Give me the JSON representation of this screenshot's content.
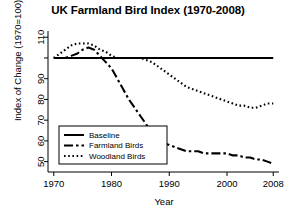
{
  "chart_data": {
    "type": "line",
    "title": "UK Farmland Bird Index (1970-2008)",
    "xlabel": "Year",
    "ylabel": "Index of Change (1970=100)",
    "xlim": [
      1969,
      2009
    ],
    "ylim": [
      45,
      113
    ],
    "grid": false,
    "legend_position": "bottom-left",
    "xticks": [
      1970,
      1980,
      1990,
      2000,
      2008
    ],
    "xtick_labels": [
      "1970",
      "1980",
      "1990",
      "2000",
      "2008"
    ],
    "yticks": [
      50,
      60,
      70,
      80,
      90,
      100,
      110
    ],
    "ytick_labels": [
      "50",
      "60",
      "70",
      "80",
      "90",
      "",
      "110"
    ],
    "x": [
      1970,
      1971,
      1972,
      1973,
      1974,
      1975,
      1976,
      1977,
      1978,
      1979,
      1980,
      1981,
      1982,
      1983,
      1984,
      1985,
      1986,
      1987,
      1988,
      1989,
      1990,
      1991,
      1992,
      1993,
      1994,
      1995,
      1996,
      1997,
      1998,
      1999,
      2000,
      2001,
      2002,
      2003,
      2004,
      2005,
      2006,
      2007,
      2008
    ],
    "series": [
      {
        "name": "Baseline",
        "style": "solid",
        "color": "#000000",
        "values": [
          100,
          100,
          100,
          100,
          100,
          100,
          100,
          100,
          100,
          100,
          100,
          100,
          100,
          100,
          100,
          100,
          100,
          100,
          100,
          100,
          100,
          100,
          100,
          100,
          100,
          100,
          100,
          100,
          100,
          100,
          100,
          100,
          100,
          100,
          100,
          100,
          100,
          100,
          100
        ]
      },
      {
        "name": "Farmland Birds",
        "style": "dashdot",
        "color": "#000000",
        "values": [
          100,
          100,
          100,
          101,
          102,
          104,
          105,
          104,
          101,
          98,
          95,
          90,
          85,
          80,
          76,
          72,
          68,
          64,
          61,
          59,
          58,
          57,
          56,
          55,
          55,
          55,
          54,
          54,
          54,
          54,
          54,
          53,
          53,
          52,
          52,
          51,
          51,
          50,
          49
        ]
      },
      {
        "name": "Woodland Birds",
        "style": "dotted",
        "color": "#000000",
        "values": [
          100,
          102,
          104,
          106,
          107,
          107,
          107,
          106,
          104,
          103,
          101,
          100,
          100,
          100,
          100,
          100,
          99,
          98,
          96,
          94,
          92,
          90,
          88,
          86,
          85,
          84,
          83,
          82,
          81,
          80,
          79,
          78,
          77,
          77,
          76,
          76,
          77,
          78,
          78
        ]
      }
    ]
  },
  "legend": {
    "entries": [
      {
        "label": "Baseline",
        "style": "solid"
      },
      {
        "label": "Farmland Birds",
        "style": "dashdot"
      },
      {
        "label": "Woodland Birds",
        "style": "dotted"
      }
    ]
  }
}
